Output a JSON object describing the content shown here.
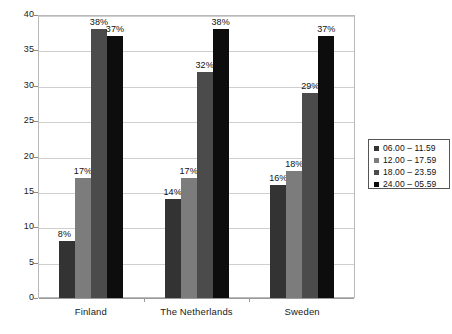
{
  "chart_data": {
    "type": "bar",
    "title": "",
    "subtitle": "",
    "xlabel": "",
    "ylabel": "",
    "ylim": [
      0,
      40
    ],
    "y_ticks": [
      "0",
      "5",
      "10",
      "15",
      "20",
      "25",
      "30",
      "35",
      "40"
    ],
    "grid": true,
    "legend_position": "right",
    "categories": [
      "Finland",
      "The Netherlands",
      "Sweden"
    ],
    "series": [
      {
        "name": "06.00 – 11.59",
        "color": "#333333",
        "values": [
          8,
          14,
          16
        ],
        "labels": [
          "8%",
          "14%",
          "16%"
        ]
      },
      {
        "name": "12.00 – 17.59",
        "color": "#7c7c7c",
        "values": [
          17,
          17,
          18
        ],
        "labels": [
          "17%",
          "17%",
          "18%"
        ]
      },
      {
        "name": "18.00 – 23.59",
        "color": "#4b4b4b",
        "values": [
          38,
          32,
          29
        ],
        "labels": [
          "38%",
          "32%",
          "29%"
        ]
      },
      {
        "name": "24.00 – 05.59",
        "color": "#0d0d0d",
        "values": [
          37,
          38,
          37
        ],
        "labels": [
          "37%",
          "38%",
          "37%"
        ]
      }
    ]
  },
  "legend": {
    "items": [
      {
        "label": "06.00 – 11.59",
        "color": "#333333"
      },
      {
        "label": "12.00 – 17.59",
        "color": "#7c7c7c"
      },
      {
        "label": "18.00 – 23.59",
        "color": "#4b4b4b"
      },
      {
        "label": "24.00 – 05.59",
        "color": "#0d0d0d"
      }
    ]
  }
}
